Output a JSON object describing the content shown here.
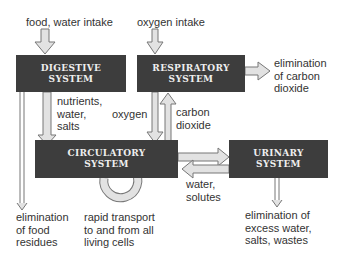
{
  "systems": {
    "digestive": {
      "line1": "DIGESTIVE",
      "line2": "SYSTEM"
    },
    "respiratory": {
      "line1": "RESPIRATORY",
      "line2": "SYSTEM"
    },
    "circulatory": {
      "line1": "CIRCULATORY",
      "line2": "SYSTEM"
    },
    "urinary": {
      "line1": "URINARY",
      "line2": "SYSTEM"
    }
  },
  "labels": {
    "food_intake": "food, water intake",
    "oxygen_intake": "oxygen intake",
    "elim_co2": "elimination\nof carbon\ndioxide",
    "nutrients": "nutrients,\nwater,\nsalts",
    "oxygen": "oxygen",
    "carbon_dioxide": "carbon\ndioxide",
    "water_solutes": "water,\nsolutes",
    "elim_food": "elimination\nof food\nresidues",
    "rapid_transport": "rapid transport\nto and from all\nliving cells",
    "elim_urinary": "elimination of\nexcess water,\nsalts, wastes"
  },
  "colors": {
    "box_fill": "#3d3d3d",
    "box_text": "#eeeeee",
    "arrow_fill": "#e2e2e2",
    "arrow_stroke": "#777777"
  }
}
